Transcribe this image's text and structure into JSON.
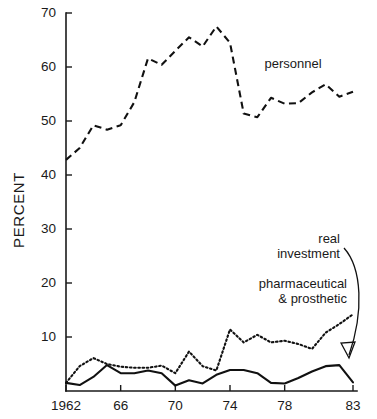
{
  "figure": {
    "width": 377,
    "height": 419,
    "background": "#ffffff",
    "ink_color": "#111111"
  },
  "axes": {
    "y_title": "PERCENT",
    "y_ticks": [
      "10",
      "20",
      "30",
      "40",
      "50",
      "60",
      "70"
    ],
    "x_ticks": [
      "1962",
      "66",
      "70",
      "74",
      "78",
      "83"
    ]
  },
  "annotations": {
    "personnel": "personnel",
    "real_investment_line1": "real",
    "real_investment_line2": "investment",
    "pharmaceutical_line1": "pharmaceutical",
    "pharmaceutical_line2": "& prosthetic"
  },
  "chart_data": {
    "type": "line",
    "title": "",
    "xlabel": "",
    "ylabel": "PERCENT",
    "xlim": [
      1962,
      1983
    ],
    "ylim": [
      0,
      70
    ],
    "grid": false,
    "legend": "inline annotations with leader arrows",
    "x": [
      1962,
      1963,
      1964,
      1965,
      1966,
      1967,
      1968,
      1969,
      1970,
      1971,
      1972,
      1973,
      1974,
      1975,
      1976,
      1977,
      1978,
      1979,
      1980,
      1981,
      1982,
      1983
    ],
    "x_tick_labels": [
      "1962",
      "66",
      "70",
      "74",
      "78",
      "83"
    ],
    "x_tick_values": [
      1962,
      1966,
      1970,
      1974,
      1978,
      1983
    ],
    "y_tick_values": [
      10,
      20,
      30,
      40,
      50,
      60,
      70
    ],
    "series": [
      {
        "name": "personnel",
        "style": "dashed",
        "values": [
          42.8,
          45.0,
          49.2,
          48.4,
          49.2,
          53.5,
          61.6,
          60.4,
          63.0,
          65.5,
          63.8,
          67.5,
          64.5,
          51.4,
          50.7,
          54.3,
          53.2,
          53.3,
          55.3,
          56.8,
          54.5,
          55.4
        ]
      },
      {
        "name": "pharmaceutical & prosthetic",
        "style": "dotted",
        "values": [
          1.5,
          4.6,
          6.1,
          5.0,
          4.5,
          4.3,
          4.3,
          4.7,
          3.3,
          7.3,
          4.6,
          3.8,
          11.4,
          9.0,
          10.4,
          9.0,
          9.3,
          8.7,
          7.8,
          10.8,
          12.4,
          14.2
        ]
      },
      {
        "name": "real investment",
        "style": "solid",
        "values": [
          1.5,
          1.1,
          2.6,
          4.8,
          3.3,
          3.3,
          3.8,
          3.3,
          1.0,
          2.0,
          1.4,
          3.0,
          3.9,
          3.9,
          3.3,
          1.5,
          1.4,
          2.4,
          3.6,
          4.6,
          4.8,
          1.6
        ]
      }
    ]
  }
}
